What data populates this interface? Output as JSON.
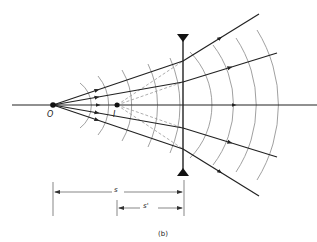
{
  "diagram": {
    "labels": {
      "object": "O",
      "image": "I",
      "object_distance": "s",
      "image_distance": "s'",
      "caption": "(b)"
    },
    "colors": {
      "ray": "#222222",
      "wavefront": "#888888",
      "virtual_ray": "#999999",
      "axis": "#222222"
    }
  }
}
